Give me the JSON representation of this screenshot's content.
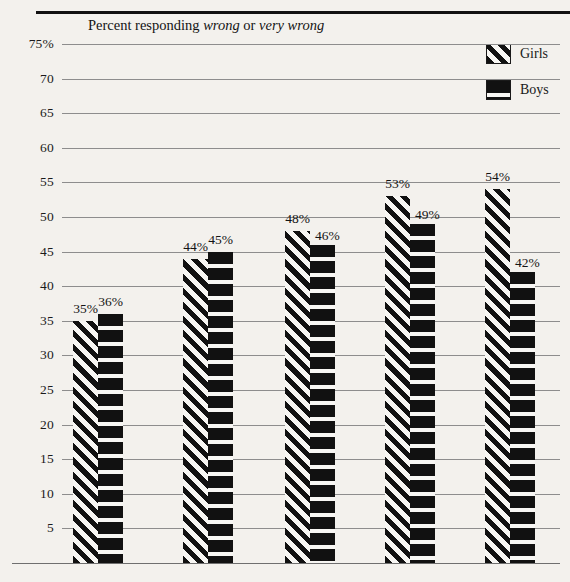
{
  "chart_data": {
    "type": "bar",
    "title": "Percent responding wrong or very wrong",
    "title_parts": [
      {
        "text": "Percent responding ",
        "italic": false
      },
      {
        "text": "wrong",
        "italic": true
      },
      {
        "text": " or ",
        "italic": false
      },
      {
        "text": "very wrong",
        "italic": true
      }
    ],
    "xlabel": "",
    "ylabel": "",
    "ylim": [
      0,
      75
    ],
    "grid": true,
    "legend_position": "top-right",
    "categories": [
      "Group 1",
      "Group 2",
      "Group 3",
      "Group 4",
      "Group 5"
    ],
    "series": [
      {
        "name": "Girls",
        "values": [
          35,
          44,
          48,
          53,
          54
        ],
        "pattern": "diagonal-stripes"
      },
      {
        "name": "Boys",
        "values": [
          36,
          45,
          46,
          49,
          42
        ],
        "pattern": "horizontal-stripes"
      }
    ],
    "data_labels": {
      "girls": [
        "35%",
        "44%",
        "48%",
        "53%",
        "54%"
      ],
      "boys": [
        "36%",
        "45%",
        "46%",
        "49%",
        "42%"
      ]
    },
    "yticks": [
      {
        "value": 75,
        "label": "75%"
      },
      {
        "value": 70,
        "label": "70"
      },
      {
        "value": 65,
        "label": "65"
      },
      {
        "value": 60,
        "label": "60"
      },
      {
        "value": 55,
        "label": "55"
      },
      {
        "value": 50,
        "label": "50"
      },
      {
        "value": 45,
        "label": "45"
      },
      {
        "value": 40,
        "label": "40"
      },
      {
        "value": 35,
        "label": "35"
      },
      {
        "value": 30,
        "label": "30"
      },
      {
        "value": 25,
        "label": "25"
      },
      {
        "value": 20,
        "label": "20"
      },
      {
        "value": 15,
        "label": "15"
      },
      {
        "value": 10,
        "label": "10"
      },
      {
        "value": 5,
        "label": "5"
      }
    ]
  },
  "legend": {
    "items": [
      {
        "label": "Girls",
        "pattern": "diagonal-stripes"
      },
      {
        "label": "Boys",
        "pattern": "horizontal-stripes"
      }
    ]
  },
  "colors": {
    "background": "#f3f1ed",
    "ink": "#111111",
    "gridline": "#8d8d8d",
    "rule": "#111111"
  }
}
